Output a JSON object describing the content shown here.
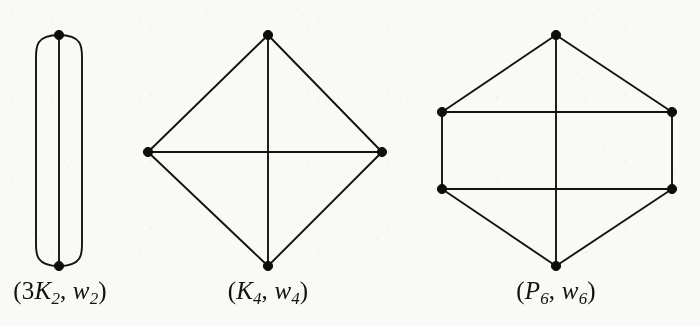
{
  "figure": {
    "caption_count": 3,
    "background_color": "#f9f9f8",
    "ink_color": "#15130f"
  },
  "graphs": [
    {
      "id": "3K2-w2",
      "label_text": "(3K2, w2)",
      "label_parts": {
        "open": "(",
        "coefficient": "3",
        "graph_symbol": "K",
        "graph_sub": "2",
        "comma": ", ",
        "weight_symbol": "w",
        "weight_sub": "2",
        "close": ")"
      },
      "description": "three parallel edges joining two vertices",
      "vertex_count": 2,
      "edge_count": 3,
      "vertices": [
        {
          "name": "top",
          "x": 59,
          "y": 35
        },
        {
          "name": "bottom",
          "x": 59,
          "y": 266
        }
      ],
      "edges": [
        {
          "from": "top",
          "to": "bottom",
          "kind": "straight"
        },
        {
          "from": "top",
          "to": "bottom",
          "kind": "arc-left"
        },
        {
          "from": "top",
          "to": "bottom",
          "kind": "arc-right"
        }
      ]
    },
    {
      "id": "K4-w4",
      "label_text": "(K4, w4)",
      "label_parts": {
        "open": "(",
        "coefficient": "",
        "graph_symbol": "K",
        "graph_sub": "4",
        "comma": ", ",
        "weight_symbol": "w",
        "weight_sub": "4",
        "close": ")"
      },
      "description": "complete graph on four vertices drawn as a diamond with both diagonals",
      "vertex_count": 4,
      "edge_count": 6,
      "vertices": [
        {
          "name": "top",
          "x": 268,
          "y": 35
        },
        {
          "name": "left",
          "x": 148,
          "y": 152
        },
        {
          "name": "right",
          "x": 382,
          "y": 152
        },
        {
          "name": "bottom",
          "x": 268,
          "y": 266
        }
      ],
      "edges": [
        {
          "from": "top",
          "to": "left",
          "kind": "straight"
        },
        {
          "from": "top",
          "to": "right",
          "kind": "straight"
        },
        {
          "from": "left",
          "to": "bottom",
          "kind": "straight"
        },
        {
          "from": "right",
          "to": "bottom",
          "kind": "straight"
        },
        {
          "from": "left",
          "to": "right",
          "kind": "straight"
        },
        {
          "from": "top",
          "to": "bottom",
          "kind": "straight"
        }
      ]
    },
    {
      "id": "P6-w6",
      "label_text": "(P6, w6)",
      "label_parts": {
        "open": "(",
        "coefficient": "",
        "graph_symbol": "P",
        "graph_sub": "6",
        "comma": ", ",
        "weight_symbol": "w",
        "weight_sub": "6",
        "close": ")"
      },
      "description": "hexagonal prism-like drawing: six vertices on a hexagon, two horizontal chords and one vertical chord",
      "vertex_count": 6,
      "edge_count": 9,
      "vertices": [
        {
          "name": "top",
          "x": 556,
          "y": 35
        },
        {
          "name": "upper-left",
          "x": 442,
          "y": 112
        },
        {
          "name": "upper-right",
          "x": 672,
          "y": 112
        },
        {
          "name": "lower-left",
          "x": 442,
          "y": 189
        },
        {
          "name": "lower-right",
          "x": 672,
          "y": 189
        },
        {
          "name": "bottom",
          "x": 556,
          "y": 266
        }
      ],
      "edges": [
        {
          "from": "top",
          "to": "upper-left",
          "kind": "straight"
        },
        {
          "from": "top",
          "to": "upper-right",
          "kind": "straight"
        },
        {
          "from": "upper-left",
          "to": "lower-left",
          "kind": "straight"
        },
        {
          "from": "upper-right",
          "to": "lower-right",
          "kind": "straight"
        },
        {
          "from": "lower-left",
          "to": "bottom",
          "kind": "straight"
        },
        {
          "from": "lower-right",
          "to": "bottom",
          "kind": "straight"
        },
        {
          "from": "upper-left",
          "to": "upper-right",
          "kind": "straight"
        },
        {
          "from": "lower-left",
          "to": "lower-right",
          "kind": "straight"
        },
        {
          "from": "top",
          "to": "bottom",
          "kind": "straight"
        }
      ]
    }
  ]
}
